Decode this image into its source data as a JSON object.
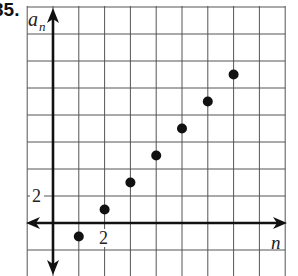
{
  "problem": {
    "number": "35."
  },
  "chart_data": {
    "type": "scatter",
    "title": "",
    "xlabel": "n",
    "ylabel": "a_n",
    "x": [
      1,
      2,
      3,
      4,
      5,
      6,
      7
    ],
    "y": [
      -0.5,
      0.5,
      1.5,
      2.5,
      3.5,
      4.5,
      5.5
    ],
    "series": [
      {
        "name": "a_n",
        "x": [
          1,
          2,
          3,
          4,
          5,
          6,
          7
        ],
        "values": [
          -0.5,
          0.5,
          1.5,
          2.5,
          3.5,
          4.5,
          5.5
        ]
      }
    ],
    "xlim": [
      -1,
      9
    ],
    "ylim": [
      -2,
      8
    ],
    "x_tick_labels": [
      {
        "value": 2,
        "label": "2"
      }
    ],
    "y_tick_labels": [
      {
        "value": 2,
        "label": "2"
      }
    ],
    "grid": true,
    "grid_step": 1,
    "legend": null
  },
  "colors": {
    "ink": "#111111",
    "grid": "#555555",
    "background": "#ffffff"
  }
}
